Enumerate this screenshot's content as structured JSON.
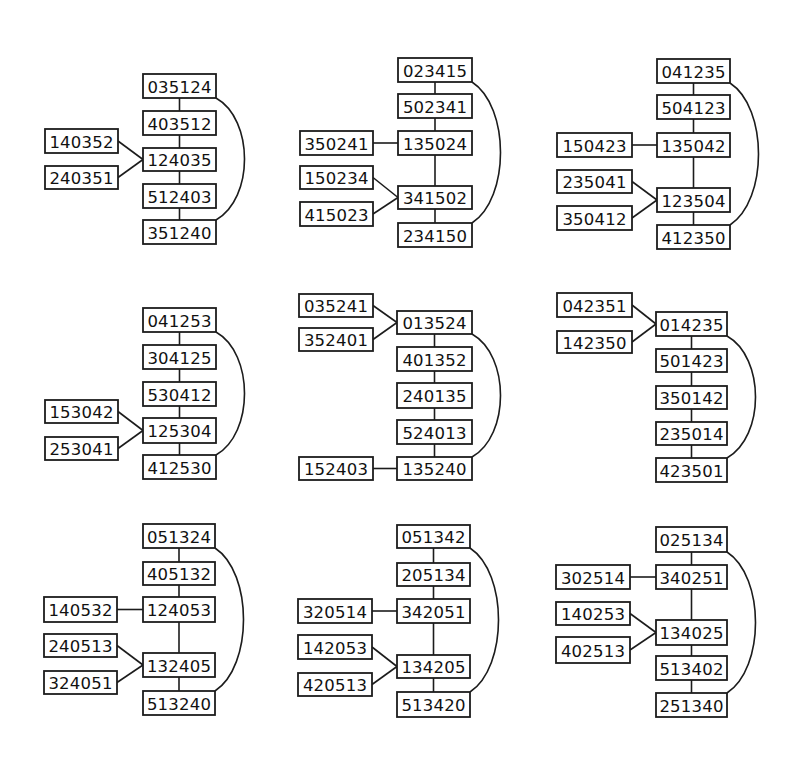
{
  "figure": {
    "diagrams": [
      {
        "id": "d1",
        "nodes": [
          {
            "id": "a",
            "label": "035124",
            "x": 143,
            "y": 74,
            "w": 73,
            "h": 24
          },
          {
            "id": "b",
            "label": "403512",
            "x": 143,
            "y": 111,
            "w": 73,
            "h": 24
          },
          {
            "id": "c",
            "label": "124035",
            "x": 143,
            "y": 148,
            "w": 73,
            "h": 23
          },
          {
            "id": "d",
            "label": "512403",
            "x": 143,
            "y": 184,
            "w": 73,
            "h": 24
          },
          {
            "id": "e",
            "label": "351240",
            "x": 143,
            "y": 220,
            "w": 73,
            "h": 24
          },
          {
            "id": "s1",
            "label": "140352",
            "x": 45,
            "y": 129,
            "w": 73,
            "h": 24
          },
          {
            "id": "s2",
            "label": "240351",
            "x": 45,
            "y": 166,
            "w": 73,
            "h": 23
          }
        ],
        "edges": [
          [
            "a",
            "b",
            "v"
          ],
          [
            "b",
            "c",
            "v"
          ],
          [
            "c",
            "d",
            "v"
          ],
          [
            "d",
            "e",
            "v"
          ],
          [
            "s1",
            "c",
            "side"
          ],
          [
            "s2",
            "c",
            "side"
          ]
        ],
        "arc": [
          "a",
          "e"
        ]
      },
      {
        "id": "d2",
        "nodes": [
          {
            "id": "a",
            "label": "023415",
            "x": 398,
            "y": 58,
            "w": 74,
            "h": 24
          },
          {
            "id": "b",
            "label": "502341",
            "x": 398,
            "y": 94,
            "w": 74,
            "h": 24
          },
          {
            "id": "c",
            "label": "135024",
            "x": 398,
            "y": 131,
            "w": 74,
            "h": 24
          },
          {
            "id": "d",
            "label": "341502",
            "x": 398,
            "y": 186,
            "w": 74,
            "h": 23
          },
          {
            "id": "e",
            "label": "234150",
            "x": 398,
            "y": 223,
            "w": 74,
            "h": 24
          },
          {
            "id": "s1",
            "label": "350241",
            "x": 300,
            "y": 131,
            "w": 73,
            "h": 24
          },
          {
            "id": "s2",
            "label": "150234",
            "x": 300,
            "y": 166,
            "w": 73,
            "h": 23
          },
          {
            "id": "s3",
            "label": "415023",
            "x": 300,
            "y": 202,
            "w": 73,
            "h": 24
          }
        ],
        "edges": [
          [
            "a",
            "b",
            "v"
          ],
          [
            "b",
            "c",
            "v"
          ],
          [
            "c",
            "d",
            "v"
          ],
          [
            "d",
            "e",
            "v"
          ],
          [
            "s1",
            "c",
            "side"
          ],
          [
            "s2",
            "d",
            "side"
          ],
          [
            "s3",
            "d",
            "side"
          ]
        ],
        "arc": [
          "a",
          "e"
        ]
      },
      {
        "id": "d3",
        "nodes": [
          {
            "id": "a",
            "label": "041235",
            "x": 657,
            "y": 59,
            "w": 73,
            "h": 24
          },
          {
            "id": "b",
            "label": "504123",
            "x": 657,
            "y": 95,
            "w": 73,
            "h": 24
          },
          {
            "id": "c",
            "label": "135042",
            "x": 657,
            "y": 133,
            "w": 73,
            "h": 24
          },
          {
            "id": "d",
            "label": "123504",
            "x": 657,
            "y": 188,
            "w": 73,
            "h": 24
          },
          {
            "id": "e",
            "label": "412350",
            "x": 657,
            "y": 225,
            "w": 73,
            "h": 24
          },
          {
            "id": "s1",
            "label": "150423",
            "x": 557,
            "y": 133,
            "w": 75,
            "h": 24
          },
          {
            "id": "s2",
            "label": "235041",
            "x": 557,
            "y": 170,
            "w": 75,
            "h": 23
          },
          {
            "id": "s3",
            "label": "350412",
            "x": 557,
            "y": 206,
            "w": 75,
            "h": 24
          }
        ],
        "edges": [
          [
            "a",
            "b",
            "v"
          ],
          [
            "b",
            "c",
            "v"
          ],
          [
            "c",
            "d",
            "v"
          ],
          [
            "d",
            "e",
            "v"
          ],
          [
            "s1",
            "c",
            "side"
          ],
          [
            "s2",
            "d",
            "side"
          ],
          [
            "s3",
            "d",
            "side"
          ]
        ],
        "arc": [
          "a",
          "e"
        ]
      },
      {
        "id": "d4",
        "nodes": [
          {
            "id": "a",
            "label": "041253",
            "x": 143,
            "y": 308,
            "w": 73,
            "h": 24
          },
          {
            "id": "b",
            "label": "304125",
            "x": 143,
            "y": 345,
            "w": 73,
            "h": 24
          },
          {
            "id": "c",
            "label": "530412",
            "x": 143,
            "y": 382,
            "w": 73,
            "h": 24
          },
          {
            "id": "d",
            "label": "125304",
            "x": 143,
            "y": 418,
            "w": 73,
            "h": 25
          },
          {
            "id": "e",
            "label": "412530",
            "x": 143,
            "y": 455,
            "w": 73,
            "h": 24
          },
          {
            "id": "s1",
            "label": "153042",
            "x": 45,
            "y": 400,
            "w": 73,
            "h": 23
          },
          {
            "id": "s2",
            "label": "253041",
            "x": 45,
            "y": 437,
            "w": 73,
            "h": 23
          }
        ],
        "edges": [
          [
            "a",
            "b",
            "v"
          ],
          [
            "b",
            "c",
            "v"
          ],
          [
            "c",
            "d",
            "v"
          ],
          [
            "d",
            "e",
            "v"
          ],
          [
            "s1",
            "d",
            "side"
          ],
          [
            "s2",
            "d",
            "side"
          ]
        ],
        "arc": [
          "a",
          "e"
        ]
      },
      {
        "id": "d5",
        "nodes": [
          {
            "id": "a",
            "label": "013524",
            "x": 397,
            "y": 311,
            "w": 75,
            "h": 23
          },
          {
            "id": "b",
            "label": "401352",
            "x": 397,
            "y": 347,
            "w": 75,
            "h": 24
          },
          {
            "id": "c",
            "label": "240135",
            "x": 397,
            "y": 383,
            "w": 75,
            "h": 25
          },
          {
            "id": "d",
            "label": "524013",
            "x": 397,
            "y": 420,
            "w": 75,
            "h": 24
          },
          {
            "id": "e",
            "label": "135240",
            "x": 397,
            "y": 457,
            "w": 75,
            "h": 23
          },
          {
            "id": "s1",
            "label": "035241",
            "x": 299,
            "y": 294,
            "w": 74,
            "h": 23
          },
          {
            "id": "s2",
            "label": "352401",
            "x": 299,
            "y": 328,
            "w": 74,
            "h": 23
          },
          {
            "id": "s3",
            "label": "152403",
            "x": 299,
            "y": 457,
            "w": 74,
            "h": 23
          }
        ],
        "edges": [
          [
            "a",
            "b",
            "v"
          ],
          [
            "b",
            "c",
            "v"
          ],
          [
            "c",
            "d",
            "v"
          ],
          [
            "d",
            "e",
            "v"
          ],
          [
            "s1",
            "a",
            "side"
          ],
          [
            "s2",
            "a",
            "side"
          ],
          [
            "s3",
            "e",
            "side"
          ]
        ],
        "arc": [
          "a",
          "e"
        ]
      },
      {
        "id": "d6",
        "nodes": [
          {
            "id": "a",
            "label": "014235",
            "x": 656,
            "y": 312,
            "w": 71,
            "h": 24
          },
          {
            "id": "b",
            "label": "501423",
            "x": 656,
            "y": 349,
            "w": 71,
            "h": 23
          },
          {
            "id": "c",
            "label": "350142",
            "x": 656,
            "y": 386,
            "w": 71,
            "h": 23
          },
          {
            "id": "d",
            "label": "235014",
            "x": 656,
            "y": 422,
            "w": 71,
            "h": 23
          },
          {
            "id": "e",
            "label": "423501",
            "x": 656,
            "y": 458,
            "w": 71,
            "h": 24
          },
          {
            "id": "s1",
            "label": "042351",
            "x": 557,
            "y": 293,
            "w": 75,
            "h": 24
          },
          {
            "id": "s2",
            "label": "142350",
            "x": 557,
            "y": 331,
            "w": 75,
            "h": 22
          }
        ],
        "edges": [
          [
            "a",
            "b",
            "v"
          ],
          [
            "b",
            "c",
            "v"
          ],
          [
            "c",
            "d",
            "v"
          ],
          [
            "d",
            "e",
            "v"
          ],
          [
            "s1",
            "a",
            "side"
          ],
          [
            "s2",
            "a",
            "side"
          ]
        ],
        "arc": [
          "a",
          "e"
        ]
      },
      {
        "id": "d7",
        "nodes": [
          {
            "id": "a",
            "label": "051324",
            "x": 143,
            "y": 524,
            "w": 72,
            "h": 24
          },
          {
            "id": "b",
            "label": "405132",
            "x": 143,
            "y": 562,
            "w": 72,
            "h": 23
          },
          {
            "id": "c",
            "label": "124053",
            "x": 143,
            "y": 597,
            "w": 72,
            "h": 25
          },
          {
            "id": "d",
            "label": "132405",
            "x": 143,
            "y": 653,
            "w": 72,
            "h": 24
          },
          {
            "id": "e",
            "label": "513240",
            "x": 143,
            "y": 691,
            "w": 72,
            "h": 24
          },
          {
            "id": "s1",
            "label": "140532",
            "x": 44,
            "y": 597,
            "w": 73,
            "h": 25
          },
          {
            "id": "s2",
            "label": "240513",
            "x": 44,
            "y": 634,
            "w": 73,
            "h": 23
          },
          {
            "id": "s3",
            "label": "324051",
            "x": 44,
            "y": 671,
            "w": 73,
            "h": 23
          }
        ],
        "edges": [
          [
            "a",
            "b",
            "v"
          ],
          [
            "b",
            "c",
            "v"
          ],
          [
            "c",
            "d",
            "v"
          ],
          [
            "d",
            "e",
            "v"
          ],
          [
            "s1",
            "c",
            "side"
          ],
          [
            "s2",
            "d",
            "side"
          ],
          [
            "s3",
            "d",
            "side"
          ]
        ],
        "arc": [
          "a",
          "e"
        ]
      },
      {
        "id": "d8",
        "nodes": [
          {
            "id": "a",
            "label": "051342",
            "x": 397,
            "y": 525,
            "w": 73,
            "h": 23
          },
          {
            "id": "b",
            "label": "205134",
            "x": 397,
            "y": 563,
            "w": 73,
            "h": 23
          },
          {
            "id": "c",
            "label": "342051",
            "x": 397,
            "y": 599,
            "w": 73,
            "h": 24
          },
          {
            "id": "d",
            "label": "134205",
            "x": 397,
            "y": 655,
            "w": 73,
            "h": 23
          },
          {
            "id": "e",
            "label": "513420",
            "x": 397,
            "y": 692,
            "w": 73,
            "h": 25
          },
          {
            "id": "s1",
            "label": "320514",
            "x": 298,
            "y": 599,
            "w": 74,
            "h": 24
          },
          {
            "id": "s2",
            "label": "142053",
            "x": 298,
            "y": 635,
            "w": 74,
            "h": 24
          },
          {
            "id": "s3",
            "label": "420513",
            "x": 298,
            "y": 673,
            "w": 74,
            "h": 23
          }
        ],
        "edges": [
          [
            "a",
            "b",
            "v"
          ],
          [
            "b",
            "c",
            "v"
          ],
          [
            "c",
            "d",
            "v"
          ],
          [
            "d",
            "e",
            "v"
          ],
          [
            "s1",
            "c",
            "side"
          ],
          [
            "s2",
            "d",
            "side"
          ],
          [
            "s3",
            "d",
            "side"
          ]
        ],
        "arc": [
          "a",
          "e"
        ]
      },
      {
        "id": "d9",
        "nodes": [
          {
            "id": "a",
            "label": "025134",
            "x": 656,
            "y": 527,
            "w": 71,
            "h": 25
          },
          {
            "id": "b",
            "label": "340251",
            "x": 656,
            "y": 565,
            "w": 71,
            "h": 24
          },
          {
            "id": "c",
            "label": "134025",
            "x": 656,
            "y": 620,
            "w": 71,
            "h": 25
          },
          {
            "id": "d",
            "label": "513402",
            "x": 656,
            "y": 656,
            "w": 71,
            "h": 24
          },
          {
            "id": "e",
            "label": "251340",
            "x": 656,
            "y": 693,
            "w": 71,
            "h": 24
          },
          {
            "id": "s1",
            "label": "302514",
            "x": 556,
            "y": 565,
            "w": 74,
            "h": 24
          },
          {
            "id": "s2",
            "label": "140253",
            "x": 556,
            "y": 602,
            "w": 74,
            "h": 23
          },
          {
            "id": "s3",
            "label": "402513",
            "x": 556,
            "y": 637,
            "w": 74,
            "h": 26
          }
        ],
        "edges": [
          [
            "a",
            "b",
            "v"
          ],
          [
            "b",
            "c",
            "v"
          ],
          [
            "c",
            "d",
            "v"
          ],
          [
            "d",
            "e",
            "v"
          ],
          [
            "s1",
            "b",
            "side"
          ],
          [
            "s2",
            "c",
            "side"
          ],
          [
            "s3",
            "c",
            "side"
          ]
        ],
        "arc": [
          "a",
          "e"
        ]
      }
    ]
  },
  "colors": {
    "background": "#ffffff",
    "stroke": "#1c1c1c",
    "text": "#111111"
  }
}
